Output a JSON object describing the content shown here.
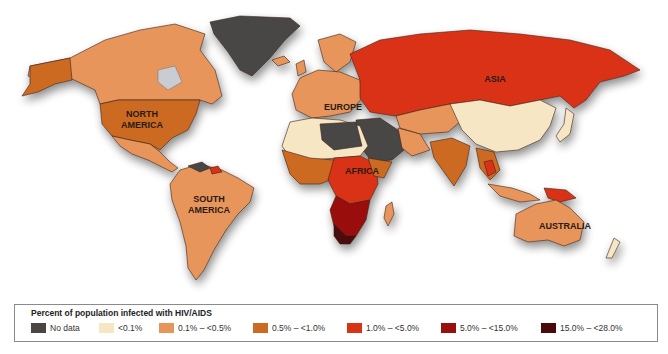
{
  "map": {
    "type": "choropleth-world",
    "subject": "HIV/AIDS prevalence",
    "region_labels": {
      "north_america": [
        "NORTH",
        "AMERICA"
      ],
      "south_america": [
        "SOUTH",
        "AMERICA"
      ],
      "europe": "EUROPE",
      "africa": "AFRICA",
      "asia": "ASIA",
      "australia": "AUSTRALIA"
    },
    "colors": {
      "no_data": "#4a4644",
      "lt_0_1": "#f6e6c4",
      "r_0_1_0_5": "#e8955c",
      "r_0_5_1_0": "#cc6a24",
      "r_1_0_5_0": "#d93316",
      "r_5_0_15_0": "#9a0e0e",
      "r_15_0_28_0": "#4a0a0c",
      "ocean_shadow": "#d8d8d8"
    }
  },
  "legend": {
    "title": "Percent of population infected with HIV/AIDS",
    "items": [
      {
        "label": "No data",
        "color": "#4a4644"
      },
      {
        "label": "<0.1%",
        "color": "#f6e6c4"
      },
      {
        "label": "0.1% – <0.5%",
        "color": "#e8955c"
      },
      {
        "label": "0.5% – <1.0%",
        "color": "#cc6a24"
      },
      {
        "label": "1.0% – <5.0%",
        "color": "#d93316"
      },
      {
        "label": "5.0% – <15.0%",
        "color": "#9a0e0e"
      },
      {
        "label": "15.0% – <28.0%",
        "color": "#4a0a0c"
      }
    ]
  }
}
